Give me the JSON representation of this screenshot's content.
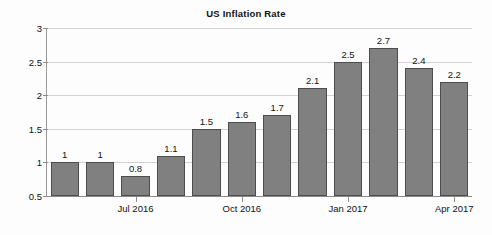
{
  "chart_data": {
    "type": "bar",
    "title": "US Inflation Rate",
    "xlabel": "",
    "ylabel": "",
    "ylim": [
      0.5,
      3
    ],
    "yticks": [
      0.5,
      1,
      1.5,
      2,
      2.5,
      3
    ],
    "ytick_labels": [
      "0.5",
      "1",
      "1.5",
      "2",
      "2.5",
      "3"
    ],
    "grid": true,
    "legend": null,
    "bar_color": "#808080",
    "bar_border_color": "#4d4d4d",
    "gridline_color": "#d2d2d2",
    "axis_color": "#8c8c8c",
    "categories": [
      "",
      "",
      "Jul 2016",
      "",
      "",
      "Oct 2016",
      "",
      "",
      "Jan 2017",
      "",
      "",
      "Apr 2017"
    ],
    "values": [
      1,
      1,
      0.8,
      1.1,
      1.5,
      1.6,
      1.7,
      2.1,
      2.5,
      2.7,
      2.4,
      2.2
    ],
    "value_labels": [
      "1",
      "1",
      "0.8",
      "1.1",
      "1.5",
      "1.6",
      "1.7",
      "2.1",
      "2.5",
      "2.7",
      "2.4",
      "2.2"
    ],
    "xtick_labels": [
      "Jul 2016",
      "Oct 2016",
      "Jan 2017",
      "Apr 2017"
    ],
    "xtick_indices": [
      2,
      5,
      8,
      11
    ]
  }
}
